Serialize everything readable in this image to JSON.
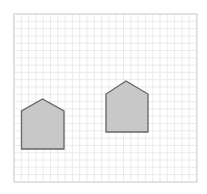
{
  "canvas": {
    "width": 207,
    "height": 194,
    "background": "#ffffff"
  },
  "grid": {
    "x": 14,
    "y": 14,
    "width": 183,
    "height": 168,
    "cell": 7.3,
    "line_color": "#e6e6e6",
    "border_color": "#cfcfcf"
  },
  "shapes": [
    {
      "name": "house-pentagon-left",
      "type": "pentagon",
      "points": [
        [
          21.5,
          149
        ],
        [
          21.5,
          111
        ],
        [
          42.5,
          99
        ],
        [
          64,
          111
        ],
        [
          64,
          149
        ]
      ],
      "fill": "#c8c8c8",
      "stroke": "#666666"
    },
    {
      "name": "house-pentagon-right",
      "type": "pentagon",
      "points": [
        [
          106,
          132
        ],
        [
          106,
          94
        ],
        [
          126,
          81
        ],
        [
          148,
          94
        ],
        [
          148,
          132
        ]
      ],
      "fill": "#c8c8c8",
      "stroke": "#666666"
    }
  ]
}
